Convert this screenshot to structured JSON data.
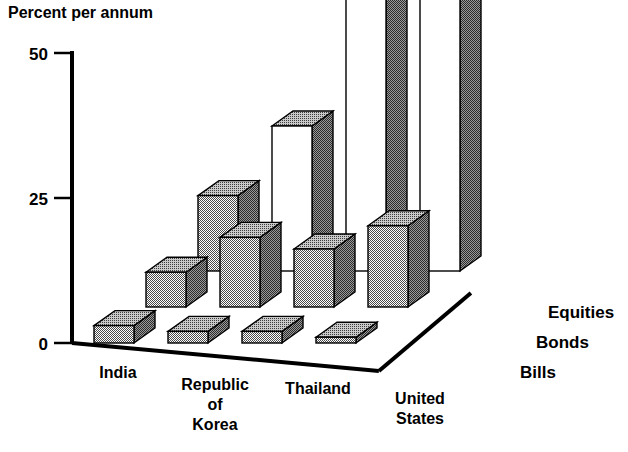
{
  "chart_data": {
    "type": "bar",
    "title": "Percent per annum",
    "subtitle": "",
    "xlabel": "",
    "ylabel": "Percent per annum",
    "ylim": [
      0,
      50
    ],
    "yticks": [
      0,
      25,
      50
    ],
    "ytick_labels": [
      "0",
      "25",
      "50"
    ],
    "grid": false,
    "legend_position": "right-depth-axis",
    "projection": "3d",
    "categories": [
      "India",
      "Republic of Korea",
      "Thailand",
      "United States"
    ],
    "category_lines": [
      [
        "India"
      ],
      [
        "Republic",
        "of",
        "Korea"
      ],
      [
        "Thailand"
      ],
      [
        "United",
        "States"
      ]
    ],
    "depth_categories": [
      "Bills",
      "Bonds",
      "Equities"
    ],
    "series": [
      {
        "name": "Bills",
        "values": [
          3,
          2,
          2,
          1
        ]
      },
      {
        "name": "Bonds",
        "values": [
          6,
          12,
          10,
          14
        ]
      },
      {
        "name": "Equities",
        "values": [
          13,
          25,
          47,
          47
        ]
      }
    ],
    "annotations": []
  },
  "axis": {
    "y_title": "Percent per annum",
    "ticks": [
      {
        "label": "50",
        "value": 50
      },
      {
        "label": "25",
        "value": 25
      },
      {
        "label": "0",
        "value": 0
      }
    ]
  },
  "category_labels": [
    {
      "id": "india",
      "lines": [
        "India"
      ]
    },
    {
      "id": "republic-of-korea",
      "lines": [
        "Republic",
        "of",
        "Korea"
      ]
    },
    {
      "id": "thailand",
      "lines": [
        "Thailand"
      ]
    },
    {
      "id": "united-states",
      "lines": [
        "United",
        "States"
      ]
    }
  ],
  "series_labels": [
    {
      "id": "equities",
      "text": "Equities"
    },
    {
      "id": "bonds",
      "text": "Bonds"
    },
    {
      "id": "bills",
      "text": "Bills"
    }
  ],
  "colors": {
    "ink": "#000000",
    "bar_front": "#b3b3b3",
    "bar_side": "#6e6e6e",
    "bar_top": "#9a9a9a",
    "bar_front_light": "#ffffff",
    "background": "#ffffff"
  }
}
